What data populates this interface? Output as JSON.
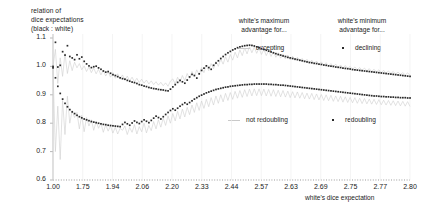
{
  "chart_data": {
    "type": "scatter",
    "title": "",
    "ylabel_lines": [
      "relation of",
      "dice expectations",
      "(black : white)"
    ],
    "xlabel": "white's dice expectation",
    "xlim": [
      0,
      1
    ],
    "ylim": [
      0.6,
      1.1
    ],
    "grid": false,
    "yticks": [
      "1.1",
      "1.0",
      "0.9",
      "0.8",
      "0.7",
      "0.6"
    ],
    "ytick_values": [
      1.1,
      1.0,
      0.9,
      0.8,
      0.7,
      0.6
    ],
    "xticks": [
      "1.00",
      "1.75",
      "1.94",
      "2.06",
      "2.20",
      "2.33",
      "2.44",
      "2.57",
      "2.63",
      "2.69",
      "2.75",
      "2.77",
      "2.80"
    ],
    "xtick_values": [
      1.0,
      1.75,
      1.94,
      2.06,
      2.2,
      2.33,
      2.44,
      2.57,
      2.63,
      2.69,
      2.75,
      2.77,
      2.8
    ],
    "legend_groups": [
      {
        "heading_lines": [
          "white's maximum",
          "advantage for..."
        ],
        "entries": [
          {
            "label": "accepting",
            "marker": "line",
            "color": "#c9c9c9"
          },
          {
            "label": "not redoubling",
            "marker": "line",
            "color": "#c9c9c9"
          }
        ]
      },
      {
        "heading_lines": [
          "white's minimum",
          "advantage for..."
        ],
        "entries": [
          {
            "label": "declining",
            "marker": "dot",
            "color": "#2a2a2a"
          },
          {
            "label": "redoubling",
            "marker": "dot",
            "color": "#2a2a2a"
          }
        ]
      }
    ],
    "series": [
      {
        "name": "declining",
        "marker": "dot",
        "color": "#2a2a2a",
        "comment": "upper dot band; white's minimum advantage for declining",
        "values": [
          1.0,
          1.085,
          0.998,
          1.004,
          1.052,
          1.04,
          1.073,
          1.035,
          1.03,
          1.024,
          1.041,
          1.027,
          1.033,
          1.018,
          1.009,
          1.002,
          0.996,
          0.999,
          1.001,
          0.995,
          0.99,
          0.984,
          0.98,
          0.982,
          0.976,
          0.971,
          0.968,
          0.964,
          0.96,
          0.957,
          0.955,
          0.951,
          0.948,
          0.945,
          0.943,
          0.94,
          0.936,
          0.934,
          0.931,
          0.929,
          0.926,
          0.924,
          0.922,
          0.921,
          0.919,
          0.918,
          0.917,
          0.915,
          0.914,
          0.92,
          0.928,
          0.936,
          0.944,
          0.951,
          0.946,
          0.941,
          0.952,
          0.963,
          0.972,
          0.968,
          0.959,
          0.974,
          0.986,
          0.994,
          1.002,
          0.996,
          0.99,
          1.004,
          1.012,
          1.02,
          1.028,
          1.035,
          1.042,
          1.048,
          1.053,
          1.058,
          1.062,
          1.066,
          1.069,
          1.071,
          1.073,
          1.074,
          1.075,
          1.074,
          1.072,
          1.069,
          1.066,
          1.063,
          1.06,
          1.057,
          1.054,
          1.051,
          1.048,
          1.045,
          1.042,
          1.04,
          1.037,
          1.035,
          1.032,
          1.03,
          1.028,
          1.026,
          1.024,
          1.022,
          1.02,
          1.018,
          1.016,
          1.014,
          1.013,
          1.011,
          1.01,
          1.008,
          1.007,
          1.005,
          1.004,
          1.002,
          1.001,
          1.0,
          0.998,
          0.997,
          0.996,
          0.994,
          0.993,
          0.992,
          0.991,
          0.989,
          0.988,
          0.987,
          0.986,
          0.985,
          0.984,
          0.983,
          0.982,
          0.981,
          0.98,
          0.979,
          0.978,
          0.977,
          0.976,
          0.975,
          0.974,
          0.973,
          0.972,
          0.971,
          0.97,
          0.969,
          0.968,
          0.967,
          0.966,
          0.965
        ]
      },
      {
        "name": "redoubling",
        "marker": "dot",
        "color": "#2a2a2a",
        "comment": "lower dot band; white's minimum advantage for redoubling",
        "values": [
          0.995,
          0.96,
          0.93,
          0.905,
          0.885,
          0.87,
          0.858,
          0.848,
          0.84,
          0.834,
          0.828,
          0.823,
          0.819,
          0.815,
          0.812,
          0.809,
          0.806,
          0.804,
          0.802,
          0.8,
          0.798,
          0.796,
          0.795,
          0.793,
          0.792,
          0.791,
          0.79,
          0.789,
          0.788,
          0.796,
          0.803,
          0.798,
          0.793,
          0.801,
          0.808,
          0.803,
          0.799,
          0.806,
          0.812,
          0.807,
          0.802,
          0.81,
          0.818,
          0.825,
          0.82,
          0.815,
          0.823,
          0.831,
          0.838,
          0.845,
          0.851,
          0.846,
          0.853,
          0.86,
          0.866,
          0.872,
          0.867,
          0.873,
          0.879,
          0.885,
          0.89,
          0.895,
          0.899,
          0.903,
          0.907,
          0.91,
          0.913,
          0.916,
          0.919,
          0.921,
          0.923,
          0.925,
          0.927,
          0.928,
          0.93,
          0.931,
          0.932,
          0.933,
          0.934,
          0.935,
          0.936,
          0.936,
          0.937,
          0.937,
          0.938,
          0.938,
          0.938,
          0.938,
          0.938,
          0.938,
          0.937,
          0.937,
          0.936,
          0.936,
          0.935,
          0.934,
          0.934,
          0.933,
          0.932,
          0.931,
          0.93,
          0.929,
          0.928,
          0.927,
          0.926,
          0.925,
          0.924,
          0.923,
          0.922,
          0.921,
          0.92,
          0.919,
          0.918,
          0.917,
          0.916,
          0.915,
          0.914,
          0.913,
          0.912,
          0.911,
          0.91,
          0.909,
          0.908,
          0.907,
          0.906,
          0.905,
          0.904,
          0.903,
          0.902,
          0.901,
          0.9,
          0.899,
          0.898,
          0.897,
          0.896,
          0.896,
          0.895,
          0.894,
          0.894,
          0.893,
          0.893,
          0.892,
          0.892,
          0.891,
          0.891,
          0.89,
          0.89,
          0.89,
          0.889,
          0.889
        ]
      },
      {
        "name": "accepting",
        "marker": "line",
        "color": "#cfcfcf",
        "comment": "upper faint jagged line; white's maximum advantage for accepting",
        "values": [
          1.0,
          1.06,
          0.94,
          1.03,
          0.965,
          1.045,
          0.975,
          1.02,
          0.985,
          1.015,
          0.995,
          1.01,
          0.988,
          1.002,
          0.982,
          0.998,
          0.978,
          0.994,
          0.974,
          0.99,
          0.97,
          0.986,
          0.966,
          0.982,
          0.962,
          0.978,
          0.958,
          0.974,
          0.955,
          0.97,
          0.952,
          0.966,
          0.949,
          0.962,
          0.946,
          0.958,
          0.943,
          0.955,
          0.941,
          0.952,
          0.938,
          0.949,
          0.936,
          0.946,
          0.934,
          0.944,
          0.932,
          0.942,
          0.93,
          0.948,
          0.956,
          0.938,
          0.962,
          0.944,
          0.968,
          0.95,
          0.975,
          0.958,
          0.982,
          0.964,
          0.988,
          0.97,
          0.996,
          0.978,
          1.004,
          0.985,
          1.01,
          0.992,
          1.018,
          1.0,
          1.026,
          1.008,
          1.034,
          1.015,
          1.042,
          1.022,
          1.05,
          1.03,
          1.058,
          1.038,
          1.065,
          1.044,
          1.07,
          1.048,
          1.068,
          1.046,
          1.064,
          1.042,
          1.06,
          1.038,
          1.056,
          1.035,
          1.052,
          1.032,
          1.048,
          1.029,
          1.044,
          1.026,
          1.04,
          1.023,
          1.036,
          1.02,
          1.032,
          1.017,
          1.028,
          1.014,
          1.025,
          1.011,
          1.022,
          1.009,
          1.019,
          1.006,
          1.016,
          1.004,
          1.013,
          1.001,
          1.01,
          0.999,
          1.008,
          0.996,
          1.005,
          0.994,
          1.003,
          0.992,
          1.0,
          0.99,
          0.998,
          0.988,
          0.996,
          0.986,
          0.994,
          0.984,
          0.992,
          0.982,
          0.99,
          0.98,
          0.988,
          0.978,
          0.986,
          0.976,
          0.984,
          0.975,
          0.982,
          0.973,
          0.98,
          0.972,
          0.978,
          0.97,
          0.977,
          0.969
        ]
      },
      {
        "name": "not redoubling",
        "marker": "line",
        "color": "#cfcfcf",
        "comment": "lower faint jagged line; white's maximum advantage for not redoubling",
        "values": [
          0.99,
          0.7,
          0.86,
          0.672,
          0.88,
          0.76,
          0.895,
          0.8,
          0.845,
          0.82,
          0.838,
          0.78,
          0.828,
          0.77,
          0.82,
          0.79,
          0.812,
          0.775,
          0.806,
          0.782,
          0.8,
          0.768,
          0.795,
          0.772,
          0.79,
          0.765,
          0.786,
          0.762,
          0.782,
          0.775,
          0.79,
          0.76,
          0.785,
          0.768,
          0.795,
          0.762,
          0.788,
          0.77,
          0.8,
          0.766,
          0.792,
          0.774,
          0.806,
          0.78,
          0.812,
          0.786,
          0.818,
          0.792,
          0.826,
          0.8,
          0.834,
          0.808,
          0.842,
          0.815,
          0.85,
          0.822,
          0.856,
          0.83,
          0.864,
          0.838,
          0.872,
          0.845,
          0.878,
          0.852,
          0.884,
          0.858,
          0.89,
          0.864,
          0.896,
          0.87,
          0.9,
          0.875,
          0.905,
          0.88,
          0.908,
          0.884,
          0.912,
          0.888,
          0.915,
          0.891,
          0.918,
          0.894,
          0.92,
          0.896,
          0.921,
          0.897,
          0.921,
          0.897,
          0.92,
          0.896,
          0.919,
          0.895,
          0.918,
          0.894,
          0.916,
          0.893,
          0.915,
          0.892,
          0.913,
          0.89,
          0.911,
          0.889,
          0.91,
          0.888,
          0.908,
          0.886,
          0.906,
          0.885,
          0.905,
          0.883,
          0.903,
          0.882,
          0.901,
          0.88,
          0.9,
          0.879,
          0.898,
          0.877,
          0.896,
          0.876,
          0.895,
          0.874,
          0.893,
          0.873,
          0.891,
          0.872,
          0.89,
          0.87,
          0.888,
          0.869,
          0.887,
          0.868,
          0.885,
          0.867,
          0.884,
          0.866,
          0.883,
          0.865,
          0.881,
          0.864,
          0.88,
          0.863,
          0.879,
          0.862,
          0.878,
          0.861,
          0.877,
          0.86,
          0.876,
          0.859
        ]
      }
    ]
  }
}
